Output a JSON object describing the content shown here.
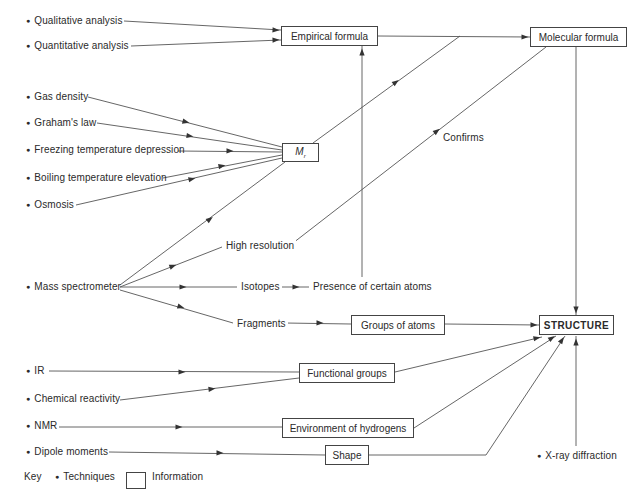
{
  "techniques": [
    {
      "id": "qualitative",
      "label": "Qualitative analysis",
      "x": 26,
      "y": 15
    },
    {
      "id": "quantitative",
      "label": "Quantitative analysis",
      "x": 26,
      "y": 40
    },
    {
      "id": "gas-density",
      "label": "Gas density",
      "x": 26,
      "y": 91
    },
    {
      "id": "grahams-law",
      "label": "Graham's law",
      "x": 26,
      "y": 117
    },
    {
      "id": "freezing",
      "label": "Freezing temperature depression",
      "x": 26,
      "y": 144
    },
    {
      "id": "boiling",
      "label": "Boiling temperature elevation",
      "x": 26,
      "y": 172
    },
    {
      "id": "osmosis",
      "label": "Osmosis",
      "x": 26,
      "y": 199
    },
    {
      "id": "mass-spec",
      "label": "Mass spectrometer",
      "x": 26,
      "y": 281
    },
    {
      "id": "ir",
      "label": "IR",
      "x": 26,
      "y": 365
    },
    {
      "id": "chem-reactivity",
      "label": "Chemical reactivity",
      "x": 26,
      "y": 393
    },
    {
      "id": "nmr",
      "label": "NMR",
      "x": 26,
      "y": 420
    },
    {
      "id": "dipole",
      "label": "Dipole moments",
      "x": 26,
      "y": 446
    },
    {
      "id": "xray",
      "label": "X-ray diffraction",
      "x": 537,
      "y": 450
    }
  ],
  "info_boxes": [
    {
      "id": "empirical",
      "label": "Empirical formula",
      "x": 281,
      "y": 26,
      "w": 97,
      "h": 20
    },
    {
      "id": "molecular",
      "label": "Molecular formula",
      "x": 530,
      "y": 27,
      "w": 97,
      "h": 20
    },
    {
      "id": "mr",
      "label": "M",
      "sub": "r",
      "x": 282,
      "y": 143,
      "w": 37,
      "h": 19
    },
    {
      "id": "groups-atoms",
      "label": "Groups of atoms",
      "x": 351,
      "y": 315,
      "w": 94,
      "h": 20
    },
    {
      "id": "structure",
      "label": "STRUCTURE",
      "x": 539,
      "y": 315,
      "w": 75,
      "h": 20
    },
    {
      "id": "functional",
      "label": "Functional groups",
      "x": 299,
      "y": 363,
      "w": 96,
      "h": 20
    },
    {
      "id": "environment",
      "label": "Environment of hydrogens",
      "x": 282,
      "y": 418,
      "w": 132,
      "h": 20
    },
    {
      "id": "shape",
      "label": "Shape",
      "x": 325,
      "y": 445,
      "w": 44,
      "h": 20
    }
  ],
  "intermediate_labels": [
    {
      "id": "high-resolution",
      "label": "High resolution",
      "x": 224,
      "y": 240
    },
    {
      "id": "isotopes",
      "label": "Isotopes",
      "x": 239,
      "y": 281
    },
    {
      "id": "presence-atoms",
      "label": "Presence of certain atoms",
      "x": 311,
      "y": 281
    },
    {
      "id": "fragments",
      "label": "Fragments",
      "x": 235,
      "y": 318
    },
    {
      "id": "confirms",
      "label": "Confirms",
      "x": 441,
      "y": 132
    }
  ],
  "edges": [
    {
      "from": "Qualitative analysis",
      "to": "Empirical formula",
      "pts": [
        [
          124,
          21
        ],
        [
          281,
          30
        ]
      ],
      "arrow": [
        276,
        30
      ]
    },
    {
      "from": "Quantitative analysis",
      "to": "Empirical formula",
      "pts": [
        [
          131,
          46
        ],
        [
          281,
          40
        ]
      ],
      "arrow": [
        276,
        40
      ]
    },
    {
      "from": "Empirical formula",
      "to": "Molecular formula",
      "pts": [
        [
          378,
          36
        ],
        [
          530,
          37
        ]
      ],
      "arrow": [
        525,
        37
      ]
    },
    {
      "from": "Gas density",
      "to": "M_r",
      "pts": [
        [
          88,
          97
        ],
        [
          282,
          147
        ]
      ],
      "arrow": [
        186,
        122
      ]
    },
    {
      "from": "Graham's law",
      "to": "M_r",
      "pts": [
        [
          97,
          123
        ],
        [
          282,
          150
        ]
      ],
      "arrow": [
        190,
        136
      ]
    },
    {
      "from": "Freezing temperature depression",
      "to": "M_r",
      "pts": [
        [
          178,
          151
        ],
        [
          282,
          152
        ]
      ],
      "arrow": [
        230,
        151
      ]
    },
    {
      "from": "Boiling temperature elevation",
      "to": "M_r",
      "pts": [
        [
          163,
          178
        ],
        [
          282,
          155
        ]
      ],
      "arrow": [
        222,
        166
      ]
    },
    {
      "from": "Osmosis",
      "to": "M_r",
      "pts": [
        [
          76,
          205
        ],
        [
          282,
          158
        ]
      ],
      "arrow": [
        192,
        179
      ]
    },
    {
      "from": "M_r",
      "to": "Molecular formula",
      "pts": [
        [
          313,
          143
        ],
        [
          460,
          36
        ]
      ],
      "arrow": [
        396,
        82
      ]
    },
    {
      "from": "Mass spectrometer",
      "to": "M_r",
      "pts": [
        [
          120,
          285
        ],
        [
          285,
          162
        ]
      ],
      "arrow": [
        210,
        219
      ]
    },
    {
      "from": "Mass spectrometer",
      "to": "High resolution",
      "pts": [
        [
          120,
          287
        ],
        [
          222,
          247
        ]
      ],
      "arrow": [
        173,
        266
      ]
    },
    {
      "from": "High resolution",
      "to": "Molecular formula",
      "pts": [
        [
          293,
          243
        ],
        [
          546,
          47
        ]
      ],
      "arrow": [
        437,
        131
      ]
    },
    {
      "from": "Mass spectrometer",
      "to": "Isotopes",
      "pts": [
        [
          120,
          287
        ],
        [
          237,
          287
        ]
      ],
      "arrow": [
        183,
        287
      ]
    },
    {
      "from": "Isotopes",
      "to": "Presence of certain atoms",
      "pts": [
        [
          277,
          287
        ],
        [
          309,
          287
        ]
      ],
      "arrow": [
        296,
        287
      ]
    },
    {
      "from": "Presence of certain atoms",
      "to": "Empirical formula",
      "pts": [
        [
          362,
          277
        ],
        [
          362,
          46
        ]
      ],
      "arrow": [
        362,
        52
      ]
    },
    {
      "from": "Mass spectrometer",
      "to": "Fragments",
      "pts": [
        [
          120,
          290
        ],
        [
          233,
          323
        ]
      ],
      "arrow": [
        181,
        307
      ]
    },
    {
      "from": "Fragments",
      "to": "Groups of atoms",
      "pts": [
        [
          285,
          323
        ],
        [
          351,
          324
        ]
      ],
      "arrow": [
        320,
        323
      ]
    },
    {
      "from": "Groups of atoms",
      "to": "STRUCTURE",
      "pts": [
        [
          445,
          324
        ],
        [
          539,
          325
        ]
      ],
      "arrow": [
        534,
        325
      ]
    },
    {
      "from": "Molecular formula",
      "to": "STRUCTURE",
      "pts": [
        [
          576,
          47
        ],
        [
          576,
          315
        ]
      ],
      "arrow": [
        576,
        310
      ]
    },
    {
      "from": "IR",
      "to": "Functional groups",
      "pts": [
        [
          49,
          371
        ],
        [
          299,
          372
        ]
      ],
      "arrow": [
        182,
        372
      ]
    },
    {
      "from": "Chemical reactivity",
      "to": "Functional groups",
      "pts": [
        [
          120,
          400
        ],
        [
          299,
          378
        ]
      ],
      "arrow": [
        212,
        389
      ]
    },
    {
      "from": "Functional groups",
      "to": "STRUCTURE",
      "pts": [
        [
          395,
          372
        ],
        [
          542,
          337
        ]
      ],
      "arrow": [
        537,
        338
      ]
    },
    {
      "from": "NMR",
      "to": "Environment of hydrogens",
      "pts": [
        [
          59,
          427
        ],
        [
          282,
          427
        ]
      ],
      "arrow": [
        179,
        427
      ]
    },
    {
      "from": "Environment of hydrogens",
      "to": "STRUCTURE",
      "pts": [
        [
          414,
          428
        ],
        [
          556,
          336
        ]
      ],
      "arrow": [
        552,
        338
      ]
    },
    {
      "from": "Dipole moments",
      "to": "Shape",
      "pts": [
        [
          109,
          452
        ],
        [
          325,
          455
        ]
      ],
      "arrow": [
        220,
        453
      ]
    },
    {
      "from": "Shape",
      "to": "STRUCTURE",
      "pts": [
        [
          369,
          455
        ],
        [
          486,
          455
        ],
        [
          565,
          336
        ]
      ],
      "arrow": [
        562,
        340
      ]
    },
    {
      "from": "X-ray diffraction",
      "to": "STRUCTURE",
      "pts": [
        [
          576,
          446
        ],
        [
          576,
          336
        ]
      ],
      "arrow": [
        576,
        342
      ]
    }
  ],
  "key": {
    "title": "Key",
    "techniques_label": "Techniques",
    "information_label": "Information"
  },
  "colors": {
    "line": "#555555",
    "text": "#2a2a2a",
    "box_border": "#444444"
  }
}
